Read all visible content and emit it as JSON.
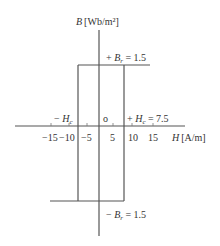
{
  "diagram": {
    "y_axis": {
      "symbol": "B",
      "unit": "[Wb/m²]"
    },
    "x_axis": {
      "symbol": "H",
      "unit": "[A/m]",
      "ticks": [
        "−15",
        "−10",
        "−5",
        "5",
        "10",
        "15"
      ]
    },
    "origin_label": "o",
    "labels": {
      "plus_br": {
        "prefix": "+ ",
        "symbol": "B",
        "sub": "r",
        "value": " = 1.5"
      },
      "minus_br": {
        "prefix": "− ",
        "symbol": "B",
        "sub": "r",
        "value": " = 1.5"
      },
      "plus_hc": {
        "prefix": "+ ",
        "symbol": "H",
        "sub": "c",
        "value": " = 7.5"
      },
      "minus_hc": {
        "prefix": "− ",
        "symbol": "H",
        "sub": "c",
        "value": ""
      }
    }
  },
  "colors": {
    "line": "#555555",
    "text": "#333333",
    "background": "#ffffff"
  }
}
